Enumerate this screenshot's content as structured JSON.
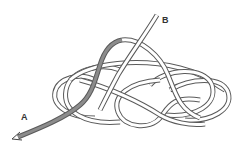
{
  "diagram": {
    "type": "knot-diagram",
    "labels": {
      "a": "A",
      "b": "B"
    },
    "colors": {
      "rope_outline": "#5a5a5a",
      "rope_fill": "#ffffff",
      "working_end": "#8c8c8c",
      "label": "#333333",
      "background": "#ffffff"
    },
    "ends": [
      {
        "id": "A",
        "description": "working end, shaded grey, with arrow pointing lower-left"
      },
      {
        "id": "B",
        "description": "standing end, exits upward to the top right"
      }
    ]
  }
}
